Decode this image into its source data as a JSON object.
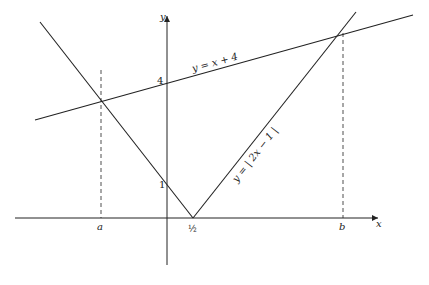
{
  "axes": {
    "x_label": "x",
    "y_label": "y"
  },
  "ticks": {
    "y_one": "1",
    "y_four": "4",
    "x_a": "a",
    "x_half": "½",
    "x_b": "b"
  },
  "curves": {
    "line_label": "y = x + 4",
    "abs_label": "y = | 2x − 1 |"
  },
  "colors": {
    "stroke": "#222222",
    "background": "#ffffff"
  }
}
